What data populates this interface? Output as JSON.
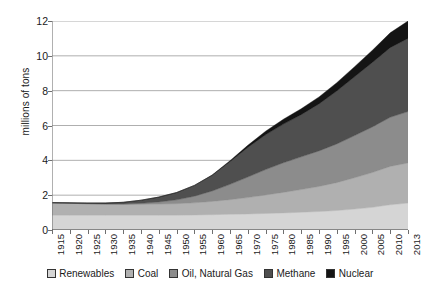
{
  "chart_data": {
    "type": "area",
    "stacked": true,
    "title": "",
    "xlabel": "",
    "ylabel": "millions of tons",
    "ylim": [
      0,
      12
    ],
    "yticks": [
      0,
      2,
      4,
      6,
      8,
      10,
      12
    ],
    "grid": true,
    "legend_position": "bottom",
    "categories": [
      "1915",
      "1920",
      "1925",
      "1930",
      "1935",
      "1940",
      "1945",
      "1950",
      "1955",
      "1960",
      "1965",
      "1970",
      "1975",
      "1980",
      "1985",
      "1990",
      "1995",
      "2000",
      "2005",
      "2010",
      "2013"
    ],
    "series": [
      {
        "name": "Renewables",
        "color": "#d5d5d5",
        "values": [
          0.85,
          0.85,
          0.85,
          0.85,
          0.85,
          0.85,
          0.85,
          0.85,
          0.86,
          0.88,
          0.9,
          0.92,
          0.95,
          0.98,
          1.02,
          1.06,
          1.12,
          1.2,
          1.3,
          1.45,
          1.55
        ]
      },
      {
        "name": "Coal",
        "color": "#b0b0b0",
        "values": [
          0.7,
          0.68,
          0.66,
          0.64,
          0.62,
          0.62,
          0.64,
          0.66,
          0.7,
          0.76,
          0.84,
          0.94,
          1.06,
          1.18,
          1.3,
          1.44,
          1.6,
          1.8,
          2.0,
          2.2,
          2.3
        ]
      },
      {
        "name": "Oil, Natural Gas",
        "color": "#8c8c8c",
        "values": [
          0.0,
          0.0,
          0.0,
          0.0,
          0.02,
          0.06,
          0.12,
          0.22,
          0.38,
          0.6,
          0.88,
          1.18,
          1.46,
          1.7,
          1.88,
          2.04,
          2.22,
          2.42,
          2.62,
          2.82,
          2.95
        ]
      },
      {
        "name": "Methane",
        "color": "#4f4f4f",
        "values": [
          0.02,
          0.03,
          0.04,
          0.06,
          0.1,
          0.18,
          0.28,
          0.42,
          0.62,
          0.9,
          1.3,
          1.7,
          2.0,
          2.22,
          2.42,
          2.7,
          3.04,
          3.38,
          3.7,
          4.0,
          4.2
        ]
      },
      {
        "name": "Nuclear",
        "color": "#141414",
        "values": [
          0.0,
          0.0,
          0.0,
          0.0,
          0.0,
          0.0,
          0.0,
          0.0,
          0.0,
          0.02,
          0.06,
          0.12,
          0.2,
          0.28,
          0.34,
          0.4,
          0.48,
          0.58,
          0.7,
          0.85,
          1.0
        ]
      }
    ],
    "totals": [
      1.57,
      1.56,
      1.55,
      1.55,
      1.59,
      1.71,
      1.89,
      2.15,
      2.56,
      3.16,
      3.98,
      4.86,
      5.67,
      6.36,
      6.96,
      7.64,
      8.46,
      9.38,
      10.32,
      11.32,
      12.0
    ]
  },
  "axes": {
    "ylabel": "millions of tons",
    "ytick_labels": [
      "0",
      "2",
      "4",
      "6",
      "8",
      "10",
      "12"
    ],
    "xtick_labels": [
      "1915",
      "1920",
      "1925",
      "1930",
      "1935",
      "1940",
      "1945",
      "1950",
      "1955",
      "1960",
      "1965",
      "1970",
      "1975",
      "1980",
      "1985",
      "1990",
      "1995",
      "2000",
      "2005",
      "2010",
      "2013"
    ]
  },
  "legend": {
    "items": [
      {
        "label": "Renewables",
        "color": "#d5d5d5"
      },
      {
        "label": "Coal",
        "color": "#b0b0b0"
      },
      {
        "label": "Oil, Natural Gas",
        "color": "#8c8c8c"
      },
      {
        "label": "Methane",
        "color": "#4f4f4f"
      },
      {
        "label": "Nuclear",
        "color": "#141414"
      }
    ]
  }
}
